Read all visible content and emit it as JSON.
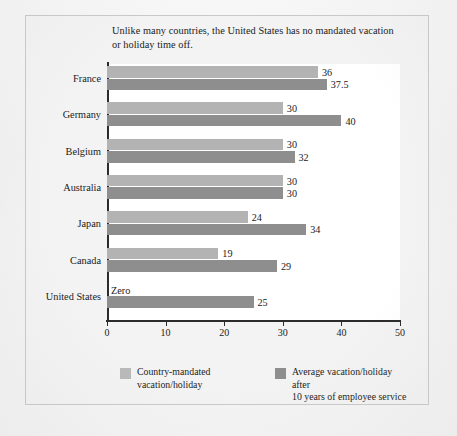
{
  "caption": "Unlike many countries, the United States has no mandated vacation or holiday time off.",
  "legend": {
    "items": [
      {
        "label": "Country-mandated\nvacation/holiday",
        "color": "#b9b9b9",
        "swatch_name": "legend-swatch-country-mandated"
      },
      {
        "label": "Average vacation/holiday after\n10 years of employee service",
        "color": "#8e8e8e",
        "swatch_name": "legend-swatch-average-after-10-years"
      }
    ]
  },
  "chart_data": {
    "type": "bar",
    "orientation": "horizontal",
    "title": "Unlike many countries, the United States has no mandated vacation or holiday time off.",
    "xlabel": "",
    "ylabel": "",
    "xlim": [
      0,
      50
    ],
    "xticks": [
      0,
      10,
      20,
      30,
      40,
      50
    ],
    "xtick_labels": [
      "0",
      "10",
      "20",
      "30",
      "40",
      "50"
    ],
    "grid": false,
    "legend_position": "bottom",
    "categories": [
      "France",
      "Germany",
      "Belgium",
      "Australia",
      "Japan",
      "Canada",
      "United States"
    ],
    "series": [
      {
        "name": "Country-mandated vacation/holiday",
        "color": "#b3b3b3",
        "values": [
          36,
          30,
          30,
          30,
          24,
          19,
          0
        ],
        "labels": [
          "36",
          "30",
          "30",
          "30",
          "24",
          "19",
          "Zero"
        ]
      },
      {
        "name": "Average vacation/holiday after 10 years of employee service",
        "color": "#8e8e8e",
        "values": [
          37.5,
          40,
          32,
          30,
          34,
          29,
          25
        ],
        "labels": [
          "37.5",
          "40",
          "32",
          "30",
          "34",
          "29",
          "25"
        ]
      }
    ]
  }
}
